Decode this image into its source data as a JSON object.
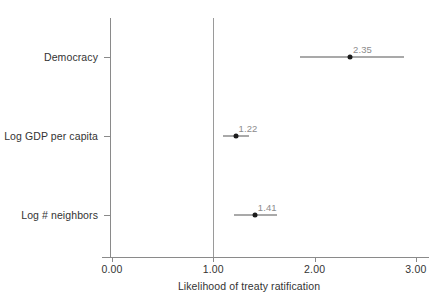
{
  "chart_data": {
    "type": "scatter",
    "subtype": "coefficient-plot",
    "title": "",
    "xlabel": "Likelihood of treaty ratification",
    "ylabel": "",
    "xlim": [
      -0.1,
      3.15
    ],
    "xticks": [
      "0.00",
      "1.00",
      "2.00",
      "3.00"
    ],
    "xtick_values": [
      0.0,
      1.0,
      2.0,
      3.0
    ],
    "grid": false,
    "legend": null,
    "reference_line": {
      "value": 1.0,
      "orientation": "vertical",
      "color": "#9a9a9a"
    },
    "categories": [
      "Democracy",
      "Log GDP per capita",
      "Log # neighbors"
    ],
    "points": [
      {
        "label": "Democracy",
        "estimate": 2.35,
        "estimate_text": "2.35",
        "ci_low": 1.86,
        "ci_high": 2.88
      },
      {
        "label": "Log GDP per capita",
        "estimate": 1.22,
        "estimate_text": "1.22",
        "ci_low": 1.1,
        "ci_high": 1.35
      },
      {
        "label": "Log # neighbors",
        "estimate": 1.41,
        "estimate_text": "1.41",
        "ci_low": 1.2,
        "ci_high": 1.63
      }
    ],
    "colors": {
      "point": "#1c1c1c",
      "interval": "#555555",
      "value_label": "#8c8c8c",
      "axis": "#8a8a8a",
      "reference": "#9a9a9a",
      "background": "#ffffff"
    }
  }
}
